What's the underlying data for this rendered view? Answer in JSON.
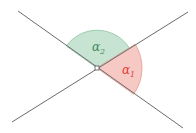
{
  "diagram": {
    "angles": [
      {
        "label": "α",
        "subscript": "1",
        "color": "#e0403a",
        "fill": "#f6c9c4"
      },
      {
        "label": "α",
        "subscript": "2",
        "color": "#3e8a5c",
        "fill": "#c7e3d2"
      }
    ],
    "line_color": "#6b6b6b"
  }
}
